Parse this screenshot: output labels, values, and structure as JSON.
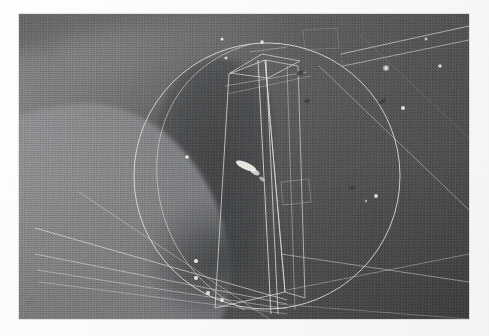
{
  "frame": {
    "kind": "photographic-still",
    "mat_color": "#fdfdfc",
    "photo_bg_color": "#4b4c4d",
    "overlay_stroke_color": "#e7e7e2",
    "vertex_marker_color": "#f4f4ef",
    "highlight_blob_color": "#f2f2ec",
    "photo_rect": {
      "x": 19,
      "y": 14,
      "width": 450,
      "height": 305
    }
  },
  "scene": {
    "description": "Low-contrast grey scene with a pale curved mass at lower left, a dark vertical lobe in the centre-left, and a flat plane filling the right half",
    "regions": [
      {
        "name": "pale-mass-lower-left",
        "tone": "#87888a"
      },
      {
        "name": "dark-lobe-centre",
        "tone": "#3f4143"
      },
      {
        "name": "flat-plane-right",
        "tone": "#4a4c4e"
      },
      {
        "name": "highlight-band-upper-left",
        "tone": "#a0a1a0"
      }
    ]
  },
  "overlay": {
    "title": "wireframe-annotation",
    "elements": [
      {
        "name": "large-circle",
        "cx": 248,
        "cy": 162,
        "r": 133
      },
      {
        "name": "tall-quad-prism",
        "faces": 3
      },
      {
        "name": "converging-lines-lower-left",
        "count": 4
      },
      {
        "name": "parallel-lines-upper-right",
        "count": 2
      },
      {
        "name": "diagonal-line-right",
        "count": 1
      },
      {
        "name": "highlight-streak-centre",
        "count": 1
      }
    ],
    "vertex_markers": [
      {
        "name": "vertex-top-a",
        "x": 222,
        "y": 39
      },
      {
        "name": "vertex-top-b",
        "x": 262,
        "y": 42
      },
      {
        "name": "vertex-upper-mid",
        "x": 226,
        "y": 58
      },
      {
        "name": "vertex-circle-left",
        "x": 187,
        "y": 157
      },
      {
        "name": "vertex-lower-1",
        "x": 196,
        "y": 261
      },
      {
        "name": "vertex-lower-2",
        "x": 196,
        "y": 278
      },
      {
        "name": "vertex-lower-3",
        "x": 208,
        "y": 293
      },
      {
        "name": "vertex-lower-4",
        "x": 222,
        "y": 300
      },
      {
        "name": "vertex-right-large",
        "x": 386,
        "y": 68
      },
      {
        "name": "vertex-right-small",
        "x": 440,
        "y": 66
      },
      {
        "name": "vertex-right-mid",
        "x": 403,
        "y": 108
      },
      {
        "name": "vertex-right-low",
        "x": 376,
        "y": 196
      },
      {
        "name": "vertex-right-far",
        "x": 426,
        "y": 39
      },
      {
        "name": "vertex-centre-plane",
        "x": 366,
        "y": 201
      }
    ],
    "dark_specks": [
      {
        "name": "speck-a",
        "x": 300,
        "y": 73
      },
      {
        "name": "speck-b",
        "x": 307,
        "y": 101
      },
      {
        "name": "speck-c",
        "x": 352,
        "y": 188
      },
      {
        "name": "speck-d",
        "x": 380,
        "y": 190
      }
    ]
  },
  "signature": {
    "line1": "• ——",
    "line2": "———",
    "line3": "▪——"
  }
}
